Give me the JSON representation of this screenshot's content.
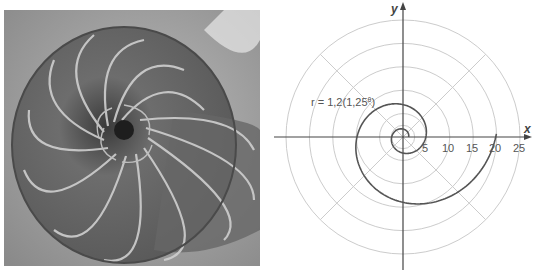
{
  "photo": {
    "subject": "Chambered nautilus shell cross-section",
    "style": "grayscale"
  },
  "chart_data": {
    "type": "polar",
    "title": "",
    "equation_label": "r = 1,2(1,25^θ)",
    "equation": {
      "r": "1.2 * 1.25^theta"
    },
    "xlabel": "x",
    "ylabel": "y",
    "radial_ticks": [
      5,
      10,
      15,
      20,
      25
    ],
    "tick_labels": [
      "5",
      "10",
      "15",
      "20",
      "25"
    ],
    "rlim": [
      0,
      25
    ],
    "grid": {
      "circles": [
        5,
        10,
        15,
        20,
        25
      ],
      "radial_lines_deg": [
        45,
        135,
        225,
        315
      ]
    },
    "theta_range_rad": [
      0,
      12.6
    ],
    "colors": {
      "curve": "#555555",
      "grid": "#c8c8c8",
      "axes": "#444444",
      "text": "#555555"
    }
  }
}
